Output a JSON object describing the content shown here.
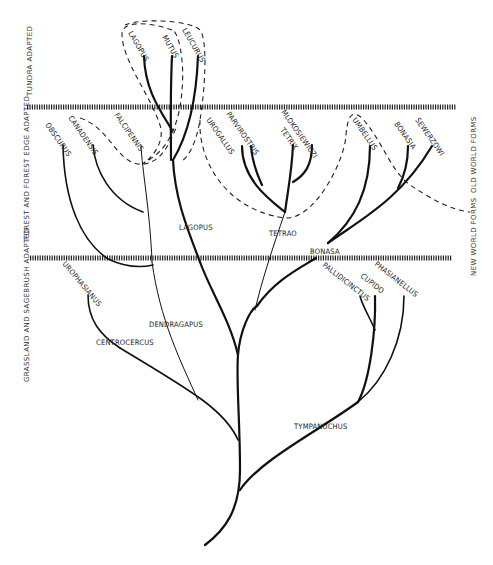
{
  "diagram": {
    "zones": {
      "tundra": "TUNDRA ADAPTED",
      "forest": "FOREST AND FOREST EDGE ADAPTED",
      "grassland": "GRASSLAND AND SAGEBRUSH ADAPTED"
    },
    "side_labels": {
      "old_world": "OLD WORLD FORMS",
      "new_world": "NEW WORLD FORMS"
    },
    "genera": {
      "lagopus": "LAGOPUS",
      "tetrao": "TETRAO",
      "bonasa": "BONASA",
      "dendragapus": "DENDRAGAPUS",
      "centrocercus": "CENTROCERCUS",
      "tympanuchus": "TYMPANUCHUS"
    },
    "species": {
      "lagopus_lagopus": "LAGOPUS",
      "mutus": "MUTUS",
      "leucurus": "LEUCURUS",
      "obscurus": "OBSCURUS",
      "canadensis": "CANADENSIS",
      "falcipennis": "FALCIPENNIS",
      "urogallus": "UROGALLUS",
      "parvirostris": "PARVIROSTRIS",
      "tetrix": "TETRIX",
      "mlokosiewiczi": "MLOKOSIEWICZI",
      "umbellus": "UMBELLUS",
      "bonasia": "BONASIA",
      "sewerzowi": "SEWERZOWI",
      "urophasianus": "UROPHASIANUS",
      "pallidicinctus": "PALLIDICINCTUS",
      "cupido": "CUPIDO",
      "phasianellus": "PHASIANELLUS"
    }
  }
}
